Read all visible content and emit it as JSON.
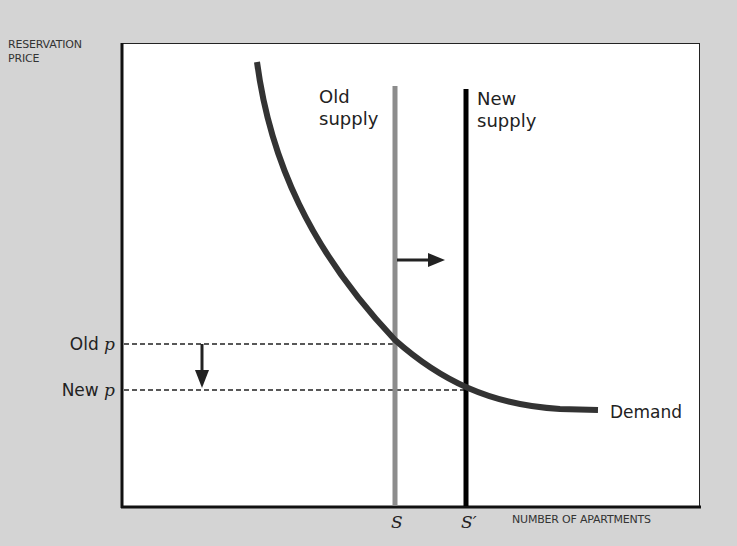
{
  "diagram": {
    "type": "supply-demand",
    "y_axis_title_line1": "RESERVATION",
    "y_axis_title_line2": "PRICE",
    "x_axis_title": "NUMBER OF APARTMENTS",
    "old_supply_line1": "Old",
    "old_supply_line2": "supply",
    "new_supply_line1": "New",
    "new_supply_line2": "supply",
    "old_price_prefix": "Old ",
    "new_price_prefix": "New ",
    "price_symbol": "p",
    "demand_label": "Demand",
    "tick_old_supply": "S",
    "tick_new_supply": "S′",
    "colors": {
      "background": "#d4d4d4",
      "plot_bg": "#ffffff",
      "demand_curve": "#333333",
      "old_supply": "#8c8c8c",
      "new_supply": "#000000"
    }
  }
}
